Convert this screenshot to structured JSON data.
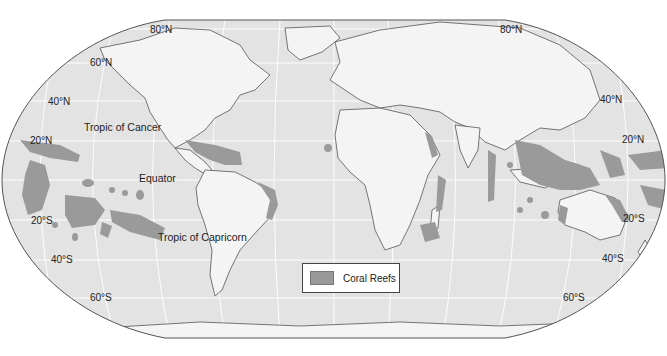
{
  "map": {
    "title": "Coral Reefs of the World",
    "projection": "Robinson",
    "colors": {
      "ocean": "#e3e3e3",
      "land": "#f4f4f4",
      "reef": "#9a9a9a",
      "border": "#555555",
      "graticule": "#ffffff"
    },
    "latitude_labels": {
      "left": [
        "80°N",
        "60°N",
        "40°N",
        "20°N",
        "20°S",
        "40°S",
        "60°S"
      ],
      "right": [
        "80°N",
        "40°N",
        "20°N",
        "20°S",
        "40°S",
        "60°S"
      ]
    },
    "annotations": {
      "tropic_cancer": "Tropic of Cancer",
      "equator": "Equator",
      "tropic_capricorn": "Tropic of Capricorn"
    },
    "legend": {
      "items": [
        {
          "label": "Coral Reefs",
          "color": "#9a9a9a"
        }
      ]
    }
  }
}
